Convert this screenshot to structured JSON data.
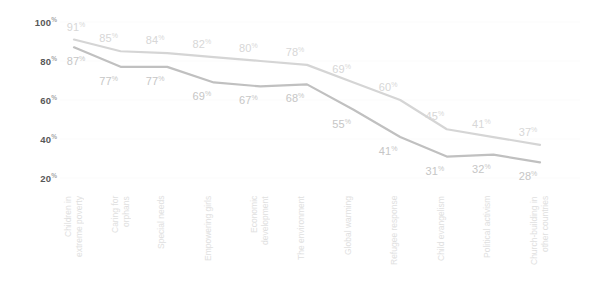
{
  "chart_data": {
    "type": "line",
    "title": "",
    "subtitle": "",
    "xlabel": "",
    "ylabel": "",
    "ylim": [
      10,
      104
    ],
    "yticks": [
      100,
      80,
      60,
      40,
      20
    ],
    "ytick_labels": [
      "100%",
      "80%",
      "60%",
      "40%",
      "20%"
    ],
    "percent_suffix": "%",
    "grid": true,
    "legend": "none",
    "categories": [
      "Children in\nextreme poverty",
      "Caring for\norphans",
      "Special needs",
      "Empowering girls",
      "Economic\ndevelopment",
      "The environment",
      "Global warming",
      "Refugee response",
      "Child evangelism",
      "Political activism",
      "Church-building in\nother countries"
    ],
    "series": [
      {
        "name": "upper-series",
        "color": "#d5d5d5",
        "label_color": "#d7d7d7",
        "values": [
          91,
          85,
          84,
          82,
          80,
          78,
          69,
          60,
          45,
          41,
          37
        ],
        "value_labels": [
          "91%",
          "85%",
          "84%",
          "82%",
          "80%",
          "78%",
          "69%",
          "60%",
          "45%",
          "41%",
          "37%"
        ]
      },
      {
        "name": "lower-series",
        "color": "#c0c0c0",
        "label_color": "#c6c6c6",
        "values": [
          87,
          77,
          77,
          69,
          67,
          68,
          55,
          41,
          31,
          32,
          28
        ],
        "value_labels": [
          "87%",
          "77%",
          "77%",
          "69%",
          "67%",
          "68%",
          "55%",
          "41%",
          "31%",
          "32%",
          "28%"
        ]
      }
    ]
  },
  "colors": {
    "background": "#ffffff",
    "grid": "#fbfbfb",
    "axis_text": "#585858",
    "category_text": "#e0e0e0"
  }
}
